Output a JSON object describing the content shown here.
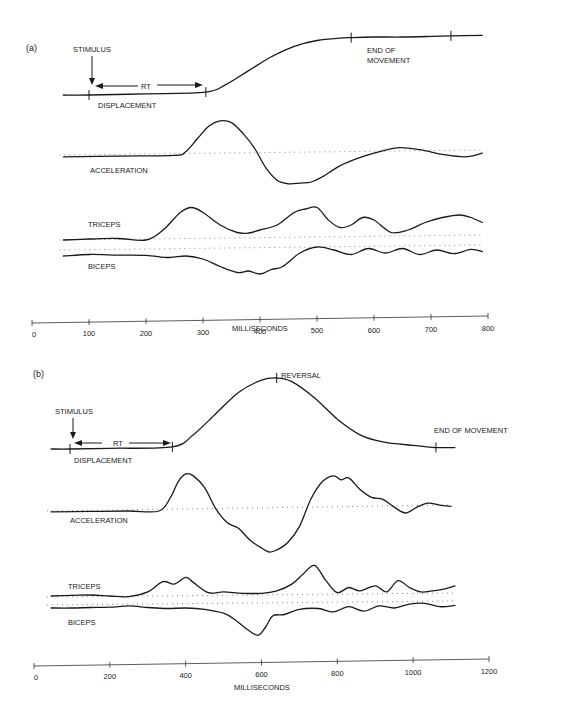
{
  "chart_data": [
    {
      "type": "line",
      "panel_label": "(a)",
      "xlabel": "MILLISECONDS",
      "xlim": [
        0,
        800
      ],
      "x_ticks": [
        0,
        100,
        200,
        300,
        400,
        500,
        600,
        700,
        800
      ],
      "annotations": {
        "stimulus": "STIMULUS",
        "rt": "RT",
        "end": "END OF MOVEMENT",
        "end_line1": "END OF",
        "end_line2": "MOVEMENT"
      },
      "events_ms": {
        "stimulus": 100,
        "movement_onset": 305,
        "end_of_movement": 560,
        "final_mark": 735
      },
      "series": [
        {
          "name": "DISPLACEMENT",
          "x": [
            55,
            100,
            200,
            305,
            340,
            380,
            420,
            460,
            500,
            540,
            560,
            600,
            650,
            700,
            735,
            790
          ],
          "y": [
            0,
            0,
            0.02,
            0.05,
            0.18,
            0.42,
            0.66,
            0.84,
            0.94,
            0.98,
            0.99,
            1.0,
            1.0,
            1.01,
            1.02,
            1.03
          ]
        },
        {
          "name": "ACCELERATION",
          "x": [
            55,
            150,
            250,
            270,
            290,
            310,
            330,
            350,
            370,
            390,
            410,
            430,
            450,
            470,
            490,
            510,
            540,
            570,
            600,
            640,
            680,
            720,
            760,
            790
          ],
          "y": [
            -0.05,
            -0.03,
            -0.01,
            0.1,
            0.45,
            0.8,
            0.95,
            0.9,
            0.6,
            0.2,
            -0.35,
            -0.7,
            -0.8,
            -0.78,
            -0.75,
            -0.6,
            -0.3,
            -0.1,
            0.05,
            0.2,
            0.15,
            0.02,
            -0.05,
            0.05
          ]
        },
        {
          "name": "TRICEPS",
          "x": [
            55,
            100,
            150,
            200,
            230,
            260,
            280,
            300,
            330,
            360,
            380,
            400,
            430,
            460,
            480,
            500,
            520,
            540,
            560,
            580,
            600,
            630,
            660,
            690,
            720,
            750,
            770,
            790
          ],
          "y": [
            0.0,
            0.02,
            0.03,
            0.0,
            0.2,
            0.55,
            0.65,
            0.55,
            0.3,
            0.15,
            0.14,
            0.2,
            0.3,
            0.55,
            0.62,
            0.65,
            0.4,
            0.25,
            0.3,
            0.45,
            0.4,
            0.15,
            0.2,
            0.35,
            0.45,
            0.5,
            0.45,
            0.35
          ]
        },
        {
          "name": "BICEPS",
          "x": [
            55,
            100,
            150,
            200,
            240,
            270,
            300,
            330,
            360,
            380,
            400,
            420,
            440,
            470,
            500,
            530,
            560,
            590,
            620,
            650,
            680,
            710,
            740,
            770,
            790
          ],
          "y": [
            0.0,
            0.05,
            0.03,
            0.02,
            -0.05,
            0.0,
            -0.1,
            -0.35,
            -0.55,
            -0.5,
            -0.6,
            -0.45,
            -0.35,
            0.1,
            0.3,
            0.2,
            0.05,
            0.25,
            0.1,
            0.25,
            0.05,
            0.2,
            0.08,
            0.22,
            0.15
          ]
        }
      ]
    },
    {
      "type": "line",
      "panel_label": "(b)",
      "xlabel": "MILLISECONDS",
      "xlim": [
        0,
        1200
      ],
      "x_ticks": [
        0,
        200,
        400,
        600,
        800,
        1000,
        1200
      ],
      "annotations": {
        "stimulus": "STIMULUS",
        "rt": "RT",
        "reversal": "REVERSAL",
        "end": "END OF MOVEMENT"
      },
      "events_ms": {
        "stimulus": 95,
        "movement_onset": 365,
        "reversal": 640,
        "end_of_movement": 1060
      },
      "series": [
        {
          "name": "DISPLACEMENT",
          "x": [
            45,
            95,
            200,
            365,
            420,
            480,
            540,
            600,
            640,
            680,
            740,
            800,
            860,
            920,
            1000,
            1060,
            1110
          ],
          "y": [
            0,
            0,
            0.01,
            0.03,
            0.2,
            0.5,
            0.8,
            0.97,
            1.0,
            0.95,
            0.72,
            0.42,
            0.2,
            0.1,
            0.05,
            0.02,
            0.02
          ]
        },
        {
          "name": "ACCELERATION",
          "x": [
            45,
            150,
            250,
            330,
            360,
            380,
            400,
            420,
            450,
            480,
            510,
            540,
            570,
            600,
            620,
            640,
            670,
            700,
            730,
            760,
            790,
            810,
            830,
            860,
            890,
            920,
            950,
            980,
            1010,
            1040,
            1070,
            1100
          ],
          "y": [
            -0.02,
            -0.01,
            0.0,
            0.0,
            0.35,
            0.75,
            0.95,
            0.9,
            0.6,
            0.05,
            -0.3,
            -0.45,
            -0.75,
            -0.95,
            -1.05,
            -1.0,
            -0.8,
            -0.4,
            0.3,
            0.75,
            0.9,
            0.8,
            0.85,
            0.55,
            0.35,
            0.3,
            0.1,
            -0.05,
            0.1,
            0.2,
            0.15,
            0.12
          ]
        },
        {
          "name": "TRICEPS",
          "x": [
            45,
            100,
            150,
            200,
            250,
            300,
            340,
            370,
            400,
            420,
            460,
            500,
            550,
            600,
            640,
            680,
            710,
            740,
            770,
            800,
            830,
            860,
            900,
            930,
            960,
            990,
            1020,
            1050,
            1080,
            1110
          ],
          "y": [
            0.0,
            0.02,
            0.03,
            0.0,
            -0.02,
            0.12,
            0.42,
            0.35,
            0.55,
            0.4,
            0.1,
            0.12,
            0.08,
            0.08,
            0.15,
            0.35,
            0.65,
            0.9,
            0.45,
            0.1,
            0.25,
            0.15,
            0.3,
            0.12,
            0.45,
            0.25,
            0.12,
            0.15,
            0.2,
            0.3
          ]
        },
        {
          "name": "BICEPS",
          "x": [
            45,
            100,
            150,
            200,
            250,
            300,
            350,
            400,
            450,
            500,
            530,
            560,
            590,
            610,
            630,
            660,
            700,
            750,
            790,
            830,
            870,
            910,
            950,
            990,
            1030,
            1070,
            1110
          ],
          "y": [
            0.0,
            0.0,
            0.02,
            0.03,
            0.08,
            0.02,
            -0.02,
            0.0,
            -0.05,
            -0.2,
            -0.45,
            -0.8,
            -1.05,
            -0.75,
            -0.3,
            -0.25,
            -0.05,
            -0.02,
            -0.15,
            0.05,
            -0.12,
            0.08,
            0.0,
            0.15,
            0.18,
            0.05,
            0.1
          ]
        }
      ]
    }
  ]
}
